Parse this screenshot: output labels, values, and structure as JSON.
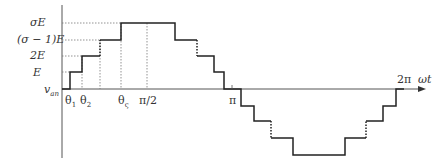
{
  "diagram": {
    "y_labels": {
      "sigmaE": "σE",
      "sigma_minus_1_E": "(σ − 1)E",
      "twoE": "2E",
      "E": "E",
      "v_an": "v",
      "v_an_sub": "an"
    },
    "x_labels": {
      "theta1": "θ",
      "theta1_sub": "1",
      "theta2": "θ",
      "theta2_sub": "2",
      "theta_s": "θ",
      "theta_s_sub": "ς",
      "pi_half": "π/2",
      "pi": "π",
      "two_pi": "2π",
      "omega_t": "ωt"
    },
    "colors": {
      "waveform": "#222222",
      "axis": "#555555",
      "guide": "#777777"
    }
  }
}
